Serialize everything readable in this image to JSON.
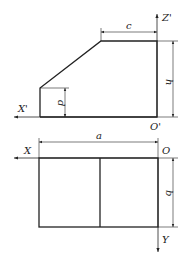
{
  "front_view": {
    "axes": {
      "horizontal": "X'",
      "vertical": "Z'",
      "origin": "O'"
    },
    "dimensions": {
      "top_width": "c",
      "height": "h",
      "left_height": "d"
    }
  },
  "top_view": {
    "axes": {
      "horizontal": "X",
      "vertical": "Y",
      "origin": "O"
    },
    "dimensions": {
      "width": "a",
      "depth": "b"
    }
  },
  "colors": {
    "line": "#222222",
    "background": "#ffffff"
  }
}
